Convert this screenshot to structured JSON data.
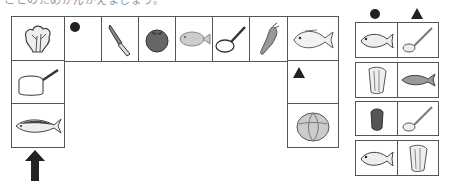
{
  "header": {
    "partial_text": "ことのためかんがえましょう。"
  },
  "main_grid": {
    "top_row": [
      {
        "item": "spinach",
        "icon": "spinach-icon"
      },
      {
        "item": "circle-mark",
        "icon": "circle-icon"
      },
      {
        "item": "knife",
        "icon": "knife-icon"
      },
      {
        "item": "tomato",
        "icon": "tomato-icon"
      },
      {
        "item": "flatfish",
        "icon": "flatfish-icon"
      },
      {
        "item": "frying-pan",
        "icon": "frying-pan-icon"
      },
      {
        "item": "carrot",
        "icon": "carrot-icon"
      },
      {
        "item": "sea-bream",
        "icon": "sea-bream-icon"
      }
    ],
    "left_column": [
      {
        "item": "saucepan",
        "icon": "saucepan-icon"
      },
      {
        "item": "mackerel",
        "icon": "mackerel-icon"
      }
    ],
    "right_column": [
      {
        "item": "triangle-mark",
        "icon": "triangle-icon"
      },
      {
        "item": "cabbage",
        "icon": "cabbage-icon"
      }
    ],
    "start_arrow": "up-arrow-icon"
  },
  "answer_panel": {
    "headers": [
      "circle",
      "triangle"
    ],
    "rows": [
      [
        "sea-bream",
        "ladle"
      ],
      [
        "lettuce",
        "salmon"
      ],
      [
        "bell-pepper",
        "ladle"
      ],
      [
        "sea-bream",
        "lettuce"
      ]
    ]
  },
  "colors": {
    "line": "#555555",
    "mark": "#222222",
    "fill_gray": "#9a9a9a"
  }
}
